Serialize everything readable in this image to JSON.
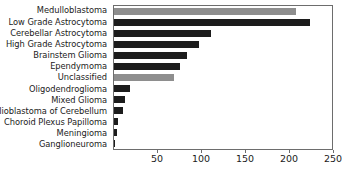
{
  "chart_data": {
    "type": "bar",
    "orientation": "horizontal",
    "title": "",
    "xlabel": "",
    "ylabel": "",
    "xlim": [
      0,
      250
    ],
    "xticks": [
      50,
      100,
      150,
      200,
      250
    ],
    "grid": false,
    "legend": null,
    "categories": [
      "Medulloblastoma",
      "Low Grade Astrocytoma",
      "Cerebellar Astrocytoma",
      "High Grade Astrocytoma",
      "Brainstem Glioma",
      "Ependymoma",
      "Unclassified",
      "Oligodendroglioma",
      "Mixed Glioma",
      "Glioblastoma of Cerebellum",
      "Choroid Plexus Papilloma",
      "Meningioma",
      "Ganglioneuroma"
    ],
    "values": [
      207,
      223,
      110,
      97,
      83,
      75,
      68,
      18,
      13,
      10,
      4,
      3,
      1
    ],
    "bar_colors": [
      "#8e8e8e",
      "#1c1c1c",
      "#1c1c1c",
      "#1c1c1c",
      "#1c1c1c",
      "#1c1c1c",
      "#8e8e8e",
      "#1c1c1c",
      "#1c1c1c",
      "#1c1c1c",
      "#1c1c1c",
      "#1c1c1c",
      "#1c1c1c"
    ]
  },
  "colors": {
    "axis": "#6d6d6d",
    "text": "#1b1b1b",
    "bar_dark": "#1c1c1c",
    "bar_gray": "#8e8e8e",
    "background": "#ffffff"
  }
}
